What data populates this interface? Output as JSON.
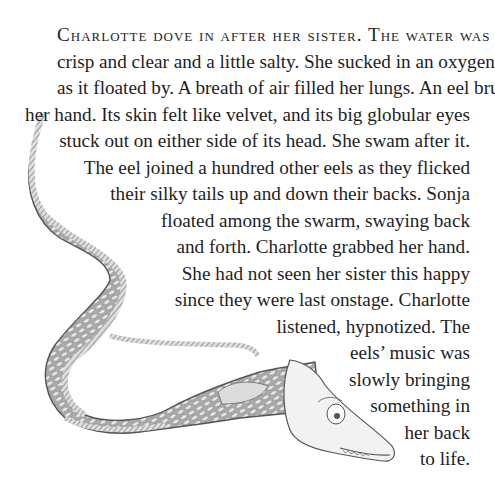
{
  "page": {
    "opening_smallcaps": "Charlotte dove in after her sister. The water was",
    "lines": [
      "crisp and clear and a little salty. She sucked in an oxygen bubble",
      "as it floated by. A breath of air filled her lungs. An eel brushed",
      "her hand. Its skin felt like velvet, and its big globular eyes",
      "stuck out on either side of its head. She swam after it.",
      "The eel joined a hundred other eels as they flicked",
      "their silky tails up and down their backs. Sonja",
      "floated among the swarm, swaying back",
      "and forth. Charlotte grabbed her hand.",
      "She had not seen her sister this happy",
      "since they were last onstage. Charlotte",
      "listened, hypnotized. The",
      "eels’ music was",
      "slowly bringing",
      "something in",
      "her back",
      "to life."
    ]
  },
  "illustration": {
    "subject": "eel-illustration",
    "style": "pencil drawing",
    "colors": {
      "body": "#b8b8b8",
      "scale": "#e6e6e6",
      "outline": "#555555",
      "head": "#f2f2f2"
    }
  }
}
